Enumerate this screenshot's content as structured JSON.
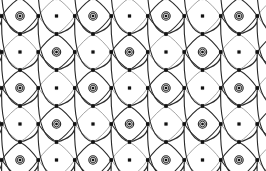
{
  "artwork": {
    "title": "Diaper Lattice Ornament",
    "type": "repeating-geometric-pattern",
    "canvas": {
      "width": 266,
      "height": 171,
      "background": "#ffffff"
    },
    "margins": {
      "left": 10,
      "top": 8,
      "right": 10,
      "bottom": 8
    },
    "colors": {
      "ink": "#1a1a1a",
      "link_stroke": "#2b2b2b",
      "faint_stroke": "#9a9a9a",
      "node_fill": "#111111",
      "node_ring": "#222222",
      "background": "#ffffff"
    },
    "lattice": {
      "description": "Diagonal diamond lattice of curved links joining dotted nodes",
      "columns": 7,
      "rows": 5,
      "cell_width": 36.5,
      "cell_height": 36,
      "origin_x": 20,
      "origin_y": 16,
      "link_style": "curved-arc",
      "link_width": 1.0,
      "diamond_half_width": 18.25,
      "diamond_half_height": 18
    },
    "nodes": {
      "bullseye": {
        "name": "concentric-node",
        "outer_radius": 4.2,
        "ring_radius": 2.8,
        "inner_radius": 1.3,
        "count_per_row": 7,
        "rows": 5
      },
      "dot": {
        "name": "square-dot-node",
        "half_size": 1.6,
        "halo_radius": 3.2,
        "halo_opacity": 0.28
      }
    },
    "repeat_unit": {
      "label": "motif",
      "contents": "bullseye node, V-curve link, small dot node",
      "width": 36.5,
      "height": 36
    }
  }
}
